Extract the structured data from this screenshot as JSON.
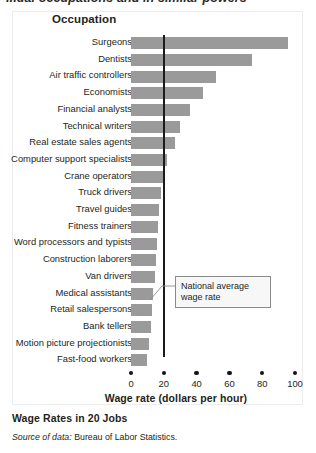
{
  "clipped_heading": "...ual occupations and in similar powers",
  "panel": {
    "column_header": "Occupation",
    "annotation": "National average wage rate"
  },
  "caption": {
    "title": "Wage Rates in 20 Jobs",
    "source_prefix": "Source of data:",
    "source_text": "Bureau of Labor Statistics."
  },
  "chart_data": {
    "type": "bar",
    "orientation": "horizontal",
    "title": "Wage Rates in 20 Jobs",
    "xlabel": "Wage rate (dollars per hour)",
    "ylabel": "Occupation",
    "xlim": [
      0,
      100
    ],
    "xticks": [
      0,
      20,
      40,
      60,
      80,
      100
    ],
    "grid": false,
    "legend": "none",
    "bar_color": "#9a9a9a",
    "reference_line": {
      "value": 20,
      "label": "National average wage rate",
      "color": "#1b1b1b"
    },
    "categories": [
      "Surgeons",
      "Dentists",
      "Air traffic controllers",
      "Economists",
      "Financial analysts",
      "Technical writers",
      "Real estate sales agents",
      "Computer support specialists",
      "Crane operators",
      "Truck drivers",
      "Travel guides",
      "Fitness trainers",
      "Word processors and typists",
      "Construction laborers",
      "Van drivers",
      "Medical assistants",
      "Retail salespersons",
      "Bank tellers",
      "Motion picture projectionists",
      "Fast-food workers"
    ],
    "values": [
      96,
      74,
      52,
      44,
      36,
      30,
      27,
      22,
      20,
      18,
      17,
      16.5,
      16,
      15,
      14.5,
      13.5,
      12.5,
      12,
      11,
      10
    ]
  }
}
